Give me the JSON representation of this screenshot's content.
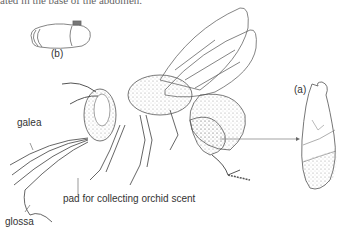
{
  "figure": {
    "top_caption_fragment": "ated in the base of the abdomen.",
    "labels": {
      "panel_a": "(a)",
      "panel_b": "(b)",
      "galea": "galea",
      "glossa": "glossa",
      "pad": "pad for collecting orchid scent"
    },
    "line_color": "#555555",
    "stipple_color": "#888888"
  }
}
